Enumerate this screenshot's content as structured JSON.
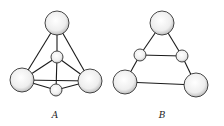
{
  "figures": [
    {
      "label": "A",
      "atoms": [
        {
          "id": "top",
          "cx": 57,
          "cy": 23,
          "r": 12,
          "size": "large"
        },
        {
          "id": "mid",
          "cx": 57,
          "cy": 57,
          "r": 6,
          "size": "small"
        },
        {
          "id": "left",
          "cx": 22,
          "cy": 80,
          "r": 12,
          "size": "large"
        },
        {
          "id": "right",
          "cx": 90,
          "cy": 81,
          "r": 12,
          "size": "large"
        },
        {
          "id": "bottom",
          "cx": 56,
          "cy": 90,
          "r": 6,
          "size": "small"
        }
      ],
      "bonds": [
        [
          "top",
          "left"
        ],
        [
          "top",
          "right"
        ],
        [
          "top",
          "mid"
        ],
        [
          "mid",
          "left"
        ],
        [
          "mid",
          "right"
        ],
        [
          "mid",
          "bottom"
        ],
        [
          "left",
          "right"
        ],
        [
          "left",
          "bottom"
        ],
        [
          "right",
          "bottom"
        ]
      ]
    },
    {
      "label": "B",
      "atoms": [
        {
          "id": "top",
          "cx": 162,
          "cy": 23,
          "r": 12,
          "size": "large"
        },
        {
          "id": "midleft",
          "cx": 140,
          "cy": 55,
          "r": 6,
          "size": "small"
        },
        {
          "id": "midright",
          "cx": 182,
          "cy": 56,
          "r": 6,
          "size": "small"
        },
        {
          "id": "left",
          "cx": 125,
          "cy": 82,
          "r": 12,
          "size": "large"
        },
        {
          "id": "right",
          "cx": 196,
          "cy": 85,
          "r": 12,
          "size": "large"
        }
      ],
      "bonds": [
        [
          "top",
          "midleft"
        ],
        [
          "top",
          "midright"
        ],
        [
          "midleft",
          "midright"
        ],
        [
          "midleft",
          "left"
        ],
        [
          "midright",
          "right"
        ],
        [
          "left",
          "right"
        ]
      ]
    }
  ],
  "labels": {
    "a": "A",
    "b": "B"
  }
}
